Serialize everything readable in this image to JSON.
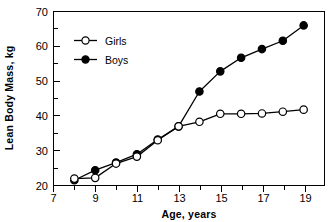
{
  "chart_data": {
    "type": "line",
    "title": "",
    "xlabel": "Age, years",
    "ylabel": "Lean Body Mass, kg",
    "x": [
      8,
      9,
      10,
      11,
      12,
      13,
      14,
      15,
      16,
      17,
      18,
      19
    ],
    "series": [
      {
        "name": "Girls",
        "marker": "open-circle",
        "color": "#000000",
        "values": [
          22.0,
          22.2,
          26.3,
          28.3,
          33.0,
          37.0,
          38.3,
          40.6,
          40.6,
          40.7,
          41.2,
          41.8
        ]
      },
      {
        "name": "Boys",
        "marker": "filled-circle",
        "color": "#000000",
        "values": [
          21.5,
          24.4,
          26.6,
          29.0,
          33.2,
          37.0,
          47.0,
          52.8,
          56.7,
          59.2,
          61.6,
          66.0
        ]
      }
    ],
    "xlim": [
      7,
      20
    ],
    "ylim": [
      20,
      70
    ],
    "xticks_major": [
      7,
      9,
      11,
      13,
      15,
      17,
      19
    ],
    "xticks_minor": [
      8,
      10,
      12,
      14,
      16,
      18,
      20
    ],
    "xtick_labels": [
      "7",
      "9",
      "11",
      "13",
      "15",
      "17",
      "19"
    ],
    "yticks_major": [
      20,
      30,
      40,
      50,
      60,
      70
    ],
    "yticks_minor": [
      25,
      35,
      45,
      55,
      65
    ],
    "ytick_labels": [
      "20",
      "30",
      "40",
      "50",
      "60",
      "70"
    ],
    "grid": false,
    "legend_position": "upper-left-inside",
    "legend_entries": [
      {
        "label": "Girls",
        "marker": "open-circle"
      },
      {
        "label": "Boys",
        "marker": "filled-circle"
      }
    ]
  }
}
